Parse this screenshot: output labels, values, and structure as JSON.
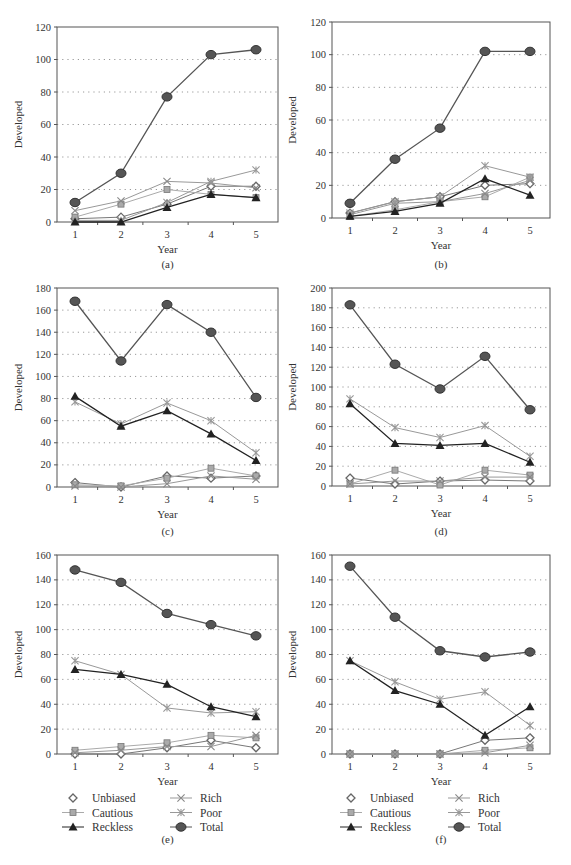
{
  "figure": {
    "legend": [
      "Unbiased",
      "Cautious",
      "Reckless",
      "Rich",
      "Poor",
      "Total"
    ],
    "colors": {
      "Total": "#555555",
      "Reckless": "#222222",
      "Rich": "#888888",
      "Poor": "#999999",
      "Cautious": "#999999",
      "Unbiased": "#666666",
      "grid": "#999999",
      "axis": "#555555"
    }
  },
  "chart_data": [
    {
      "panel": "(a)",
      "type": "line",
      "xlabel": "Year",
      "ylabel": "Developed",
      "categories": [
        1,
        2,
        3,
        4,
        5
      ],
      "ylim": [
        0,
        120
      ],
      "yticks": [
        0,
        20,
        40,
        60,
        80,
        100,
        120
      ],
      "grid": "dotted horizontal",
      "series": [
        {
          "name": "Unbiased",
          "values": [
            2,
            3,
            11,
            22,
            22
          ]
        },
        {
          "name": "Cautious",
          "values": [
            3,
            11,
            20,
            17,
            15
          ]
        },
        {
          "name": "Reckless",
          "values": [
            0,
            0,
            9,
            17,
            15
          ]
        },
        {
          "name": "Rich",
          "values": [
            7,
            13,
            25,
            24,
            21
          ]
        },
        {
          "name": "Poor",
          "values": [
            1,
            1,
            12,
            25,
            32
          ]
        },
        {
          "name": "Total",
          "values": [
            12,
            30,
            77,
            103,
            106
          ]
        }
      ]
    },
    {
      "panel": "(b)",
      "type": "line",
      "xlabel": "Year",
      "ylabel": "Developed",
      "categories": [
        1,
        2,
        3,
        4,
        5
      ],
      "ylim": [
        0,
        120
      ],
      "yticks": [
        0,
        20,
        40,
        60,
        80,
        100,
        120
      ],
      "grid": "dotted horizontal",
      "series": [
        {
          "name": "Unbiased",
          "values": [
            3,
            10,
            13,
            20,
            21
          ]
        },
        {
          "name": "Cautious",
          "values": [
            1,
            5,
            10,
            13,
            25
          ]
        },
        {
          "name": "Reckless",
          "values": [
            1,
            4,
            9,
            24,
            14
          ]
        },
        {
          "name": "Rich",
          "values": [
            2,
            9,
            10,
            15,
            23
          ]
        },
        {
          "name": "Poor",
          "values": [
            3,
            10,
            13,
            32,
            25
          ]
        },
        {
          "name": "Total",
          "values": [
            9,
            36,
            55,
            102,
            102
          ]
        }
      ]
    },
    {
      "panel": "(c)",
      "type": "line",
      "xlabel": "Year",
      "ylabel": "Developed",
      "categories": [
        1,
        2,
        3,
        4,
        5
      ],
      "ylim": [
        0,
        180
      ],
      "yticks": [
        0,
        20,
        40,
        60,
        80,
        100,
        120,
        140,
        160,
        180
      ],
      "grid": "dotted horizontal",
      "series": [
        {
          "name": "Unbiased",
          "values": [
            4,
            0,
            10,
            8,
            10
          ]
        },
        {
          "name": "Cautious",
          "values": [
            2,
            1,
            8,
            17,
            10
          ]
        },
        {
          "name": "Reckless",
          "values": [
            82,
            55,
            69,
            48,
            24
          ]
        },
        {
          "name": "Rich",
          "values": [
            1,
            0,
            3,
            10,
            7
          ]
        },
        {
          "name": "Poor",
          "values": [
            77,
            57,
            76,
            60,
            31
          ]
        },
        {
          "name": "Total",
          "values": [
            168,
            114,
            165,
            140,
            81
          ]
        }
      ]
    },
    {
      "panel": "(d)",
      "type": "line",
      "xlabel": "Year",
      "ylabel": "Developed",
      "categories": [
        1,
        2,
        3,
        4,
        5
      ],
      "ylim": [
        0,
        200
      ],
      "yticks": [
        0,
        20,
        40,
        60,
        80,
        100,
        120,
        140,
        160,
        180,
        200
      ],
      "grid": "dotted horizontal",
      "series": [
        {
          "name": "Unbiased",
          "values": [
            8,
            2,
            5,
            6,
            5
          ]
        },
        {
          "name": "Cautious",
          "values": [
            2,
            16,
            1,
            16,
            11
          ]
        },
        {
          "name": "Reckless",
          "values": [
            83,
            43,
            41,
            43,
            24
          ]
        },
        {
          "name": "Rich",
          "values": [
            2,
            5,
            5,
            9,
            9
          ]
        },
        {
          "name": "Poor",
          "values": [
            88,
            59,
            49,
            61,
            30
          ]
        },
        {
          "name": "Total",
          "values": [
            183,
            123,
            98,
            131,
            77
          ]
        }
      ]
    },
    {
      "panel": "(e)",
      "type": "line",
      "xlabel": "Year",
      "ylabel": "Developed",
      "categories": [
        1,
        2,
        3,
        4,
        5
      ],
      "ylim": [
        0,
        160
      ],
      "yticks": [
        0,
        20,
        40,
        60,
        80,
        100,
        120,
        140,
        160
      ],
      "grid": "dotted horizontal",
      "series": [
        {
          "name": "Unbiased",
          "values": [
            0,
            0,
            5,
            11,
            5
          ]
        },
        {
          "name": "Cautious",
          "values": [
            3,
            6,
            9,
            15,
            13
          ]
        },
        {
          "name": "Reckless",
          "values": [
            68,
            64,
            56,
            38,
            30
          ]
        },
        {
          "name": "Rich",
          "values": [
            1,
            3,
            6,
            6,
            15
          ]
        },
        {
          "name": "Poor",
          "values": [
            75,
            64,
            37,
            33,
            34
          ]
        },
        {
          "name": "Total",
          "values": [
            148,
            138,
            113,
            104,
            95
          ]
        }
      ]
    },
    {
      "panel": "(f)",
      "type": "line",
      "xlabel": "Year",
      "ylabel": "Developed",
      "categories": [
        1,
        2,
        3,
        4,
        5
      ],
      "ylim": [
        0,
        160
      ],
      "yticks": [
        0,
        20,
        40,
        60,
        80,
        100,
        120,
        140,
        160
      ],
      "grid": "dotted horizontal",
      "series": [
        {
          "name": "Unbiased",
          "values": [
            0,
            0,
            0,
            11,
            13
          ]
        },
        {
          "name": "Cautious",
          "values": [
            0,
            0,
            0,
            3,
            5
          ]
        },
        {
          "name": "Reckless",
          "values": [
            75,
            51,
            40,
            15,
            38
          ]
        },
        {
          "name": "Rich",
          "values": [
            0,
            0,
            0,
            1,
            7
          ]
        },
        {
          "name": "Poor",
          "values": [
            75,
            58,
            44,
            50,
            23
          ]
        },
        {
          "name": "Total",
          "values": [
            151,
            110,
            83,
            78,
            82
          ]
        }
      ]
    }
  ]
}
